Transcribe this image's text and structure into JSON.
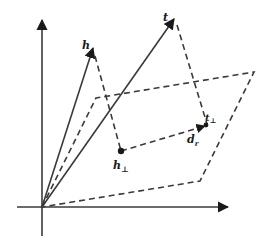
{
  "diagram": {
    "colors": {
      "background": "#ffffff",
      "stroke": "#3a3a3a",
      "ink": "#1a1a1a"
    },
    "labels": {
      "h": "h",
      "t": "t",
      "h_perp_base": "h",
      "h_perp_sub": "⊥",
      "t_perp_base": "t",
      "t_perp_sub": "⊥",
      "d_r_base": "d",
      "d_r_sub": "r"
    },
    "elements": [
      "x-axis",
      "y-axis",
      "vector h",
      "vector t",
      "dashed hyperplane (parallelogram)",
      "dashed projection h→h⊥",
      "dashed projection t→t⊥",
      "dashed translation d_r from h⊥ to t⊥"
    ]
  }
}
